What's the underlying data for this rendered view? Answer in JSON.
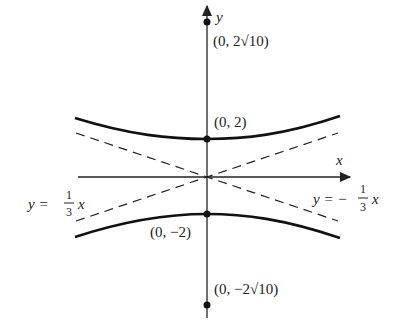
{
  "diagram": {
    "type": "hyperbola",
    "axes": {
      "x_label": "x",
      "y_label": "y"
    },
    "points": {
      "focus_top": "(0, 2√10)",
      "vertex_top": "(0, 2)",
      "vertex_bottom": "(0, −2)",
      "focus_bottom": "(0, −2√10)"
    },
    "asymptotes": {
      "left": {
        "lhs": "y = ",
        "num": "1",
        "den": "3",
        "var": "x"
      },
      "right": {
        "lhs": "y = −",
        "num": "1",
        "den": "3",
        "var": "x"
      }
    },
    "colors": {
      "curve": "#111111",
      "axis": "#222222",
      "asymptote": "#222222"
    }
  }
}
